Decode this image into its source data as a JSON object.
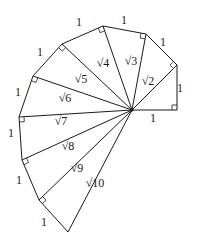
{
  "diagram": {
    "center": [
      132,
      110
    ],
    "vertices": [
      [
        177,
        110
      ],
      [
        177,
        65
      ],
      [
        146,
        34
      ],
      [
        103,
        26
      ],
      [
        62,
        44
      ],
      [
        33,
        76
      ],
      [
        19,
        117
      ],
      [
        22,
        160
      ],
      [
        39,
        200
      ],
      [
        68,
        232
      ]
    ],
    "hypotenuse_labels": [
      {
        "text": "√2",
        "x": 148,
        "y": 85
      },
      {
        "text": "√3",
        "x": 131,
        "y": 65
      },
      {
        "text": "√4",
        "x": 103,
        "y": 67
      },
      {
        "text": "√5",
        "x": 81,
        "y": 83
      },
      {
        "text": "√6",
        "x": 65,
        "y": 102
      },
      {
        "text": "√7",
        "x": 61,
        "y": 125
      },
      {
        "text": "√8",
        "x": 68,
        "y": 150
      },
      {
        "text": "√9",
        "x": 77,
        "y": 172
      },
      {
        "text": "√10",
        "x": 95,
        "y": 187
      }
    ],
    "unit_labels": [
      {
        "text": "1",
        "x": 153,
        "y": 122
      },
      {
        "text": "1",
        "x": 180,
        "y": 92
      },
      {
        "text": "1",
        "x": 163,
        "y": 46
      },
      {
        "text": "1",
        "x": 124,
        "y": 24
      },
      {
        "text": "1",
        "x": 79,
        "y": 26
      },
      {
        "text": "1",
        "x": 40,
        "y": 56
      },
      {
        "text": "1",
        "x": 18,
        "y": 96
      },
      {
        "text": "1",
        "x": 11,
        "y": 137
      },
      {
        "text": "1",
        "x": 19,
        "y": 184
      },
      {
        "text": "1",
        "x": 44,
        "y": 226
      }
    ]
  }
}
